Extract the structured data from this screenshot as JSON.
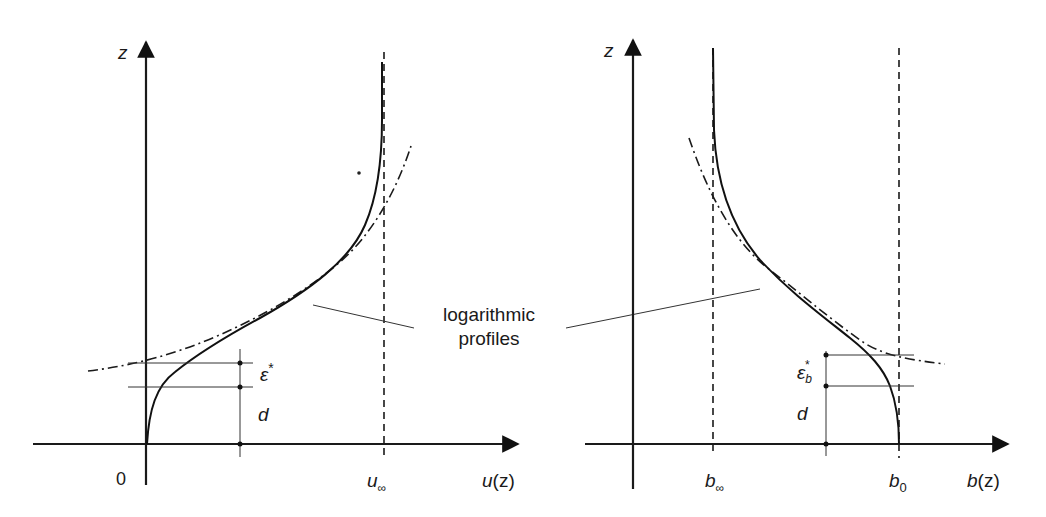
{
  "diagram": {
    "annotation": {
      "line1": "logarithmic",
      "line2": "profiles"
    },
    "left_panel": {
      "y_axis_label": "z",
      "x_axis_label": "u(z)",
      "x_axis_label_parts": {
        "func": "u",
        "arg": "(z)"
      },
      "origin_label": "0",
      "asymptote_label": {
        "base": "u",
        "sub": "∞"
      },
      "dimension_labels": {
        "epsilon": {
          "base": "ε",
          "sup": "*"
        },
        "d": "d"
      }
    },
    "right_panel": {
      "y_axis_label": "z",
      "x_axis_label": "b(z)",
      "x_axis_label_parts": {
        "func": "b",
        "arg": "(z)"
      },
      "asymptote_label": {
        "base": "b",
        "sub": "∞"
      },
      "surface_label": {
        "base": "b",
        "sub": "0"
      },
      "dimension_labels": {
        "epsilon": {
          "base": "ε",
          "sub": "b",
          "sup": "*"
        },
        "d": "d"
      }
    },
    "legend": {
      "solid": "actual profile",
      "dashed": "asymptote",
      "dash_dot": "logarithmic profile"
    }
  }
}
